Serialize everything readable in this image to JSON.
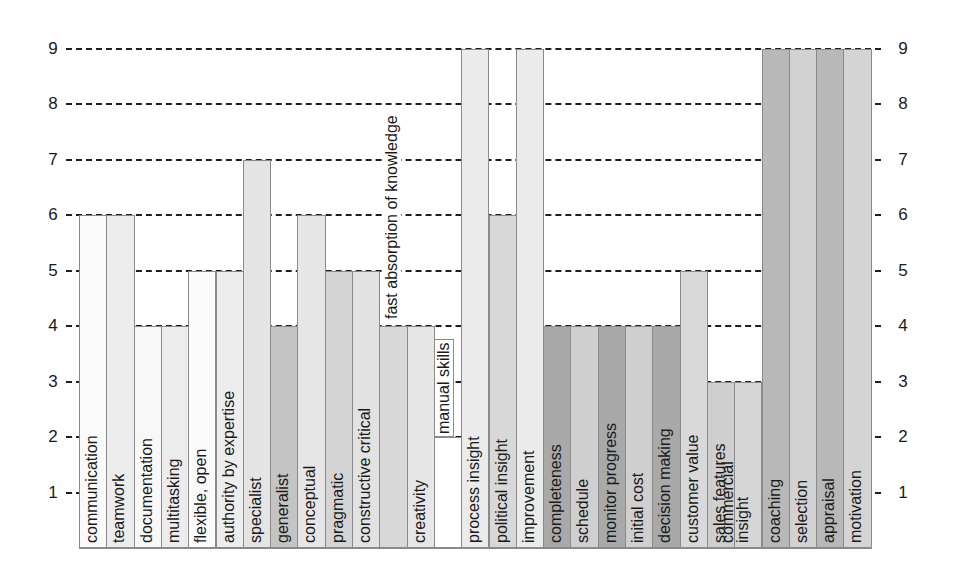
{
  "chart_data": {
    "type": "bar",
    "title": "",
    "xlabel": "",
    "ylabel": "",
    "ylim": [
      0,
      9
    ],
    "grid": {
      "on": true,
      "style": "dashed",
      "axis": "y"
    },
    "yaxis_left_ticks": [
      1,
      2,
      3,
      4,
      5,
      6,
      7,
      8,
      9
    ],
    "yaxis_right_ticks": [
      1,
      2,
      3,
      4,
      5,
      6,
      7,
      8,
      9
    ],
    "label_placement": "inside bars, rotated 90 degrees, reading bottom to top",
    "categories": [
      "communication",
      "teamwork",
      "documentation",
      "multitasking",
      "flexible, open",
      "authority by expertise",
      "specialist",
      "generalist",
      "conceptual",
      "pragmatic",
      "constructive critical",
      "fast absorption of knowledge",
      "creativity",
      "manual skills",
      "process insight",
      "political insight",
      "improvement",
      "completeness",
      "schedule",
      "monitor progress",
      "initial cost",
      "decision making",
      "customer value",
      "sales features",
      "commercial insight",
      "coaching",
      "selection",
      "appraisal",
      "motivation"
    ],
    "values": [
      6,
      6,
      4,
      4,
      5,
      5,
      7,
      4,
      6,
      5,
      5,
      4,
      4,
      2,
      9,
      6,
      9,
      4,
      4,
      4,
      4,
      4,
      5,
      3,
      3,
      9,
      9,
      9,
      9
    ],
    "colors": [
      "#fafafa",
      "#ececec",
      "#f8f8f8",
      "#ececec",
      "#fbfbfb",
      "#ededed",
      "#e4e4e4",
      "#c4c4c4",
      "#e6e6e6",
      "#d4d4d4",
      "#e2e2e2",
      "#d8d8d8",
      "#e6e6e6",
      "#ffffff",
      "#ebebeb",
      "#d8d8d8",
      "#ebebeb",
      "#a9a9a9",
      "#cfcfcf",
      "#a9a9a9",
      "#cfcfcf",
      "#a9a9a9",
      "#d9d9d9",
      "#cfcfcf",
      "#d6d6d6",
      "#b8b8b8",
      "#d2d2d2",
      "#b8b8b8",
      "#d4d4d4"
    ],
    "label_styles": {
      "11": "above-bar",
      "13": "boxed-above-bar",
      "24": "two-line"
    },
    "label_lines": {
      "24": [
        "commercial",
        "insight"
      ]
    }
  }
}
